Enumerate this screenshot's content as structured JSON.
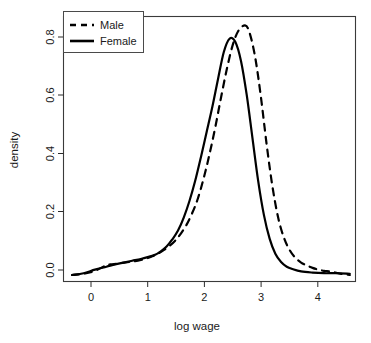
{
  "chart_data": {
    "type": "line",
    "title": "",
    "xlabel": "log wage",
    "ylabel": "density",
    "xlim": [
      -0.55,
      4.55
    ],
    "ylim": [
      -0.02,
      0.875
    ],
    "grid": false,
    "legend_position": "top-left",
    "xticks": [
      0,
      1,
      2,
      3,
      4
    ],
    "xtick_labels": [
      "0",
      "1",
      "2",
      "3",
      "4"
    ],
    "yticks": [
      0.0,
      0.2,
      0.4,
      0.6,
      0.8
    ],
    "ytick_labels": [
      "0.0",
      "0.2",
      "0.4",
      "0.6",
      "0.8"
    ],
    "series": [
      {
        "name": "Male",
        "style": "dashed",
        "color": "#000000",
        "peak_x": 2.62,
        "peak_y": 0.845,
        "x": [
          -0.4,
          -0.2,
          0.0,
          0.2,
          0.3,
          0.45,
          0.6,
          0.75,
          0.9,
          1.0,
          1.1,
          1.2,
          1.3,
          1.4,
          1.5,
          1.6,
          1.7,
          1.8,
          1.9,
          2.0,
          2.1,
          2.2,
          2.3,
          2.4,
          2.5,
          2.62,
          2.7,
          2.8,
          2.9,
          3.0,
          3.1,
          3.2,
          3.3,
          3.4,
          3.5,
          3.6,
          3.7,
          3.8,
          3.9,
          4.0,
          4.1,
          4.2,
          4.3,
          4.45
        ],
        "y": [
          0.002,
          0.006,
          0.016,
          0.035,
          0.038,
          0.042,
          0.046,
          0.05,
          0.058,
          0.065,
          0.074,
          0.086,
          0.1,
          0.118,
          0.142,
          0.172,
          0.212,
          0.262,
          0.33,
          0.41,
          0.5,
          0.6,
          0.695,
          0.775,
          0.825,
          0.845,
          0.82,
          0.735,
          0.6,
          0.44,
          0.3,
          0.195,
          0.128,
          0.086,
          0.06,
          0.044,
          0.034,
          0.026,
          0.02,
          0.016,
          0.014,
          0.01,
          0.006,
          0.002
        ]
      },
      {
        "name": "Female",
        "style": "solid",
        "color": "#000000",
        "peak_x": 2.35,
        "peak_y": 0.8,
        "x": [
          -0.4,
          -0.2,
          0.0,
          0.2,
          0.35,
          0.5,
          0.65,
          0.8,
          0.95,
          1.05,
          1.15,
          1.25,
          1.35,
          1.45,
          1.55,
          1.65,
          1.75,
          1.85,
          1.95,
          2.05,
          2.15,
          2.25,
          2.35,
          2.45,
          2.55,
          2.65,
          2.75,
          2.85,
          2.95,
          3.05,
          3.15,
          3.25,
          3.35,
          3.45,
          3.6,
          3.8,
          4.0,
          4.2,
          4.45
        ],
        "y": [
          0.002,
          0.008,
          0.02,
          0.03,
          0.038,
          0.044,
          0.05,
          0.056,
          0.064,
          0.07,
          0.082,
          0.098,
          0.122,
          0.152,
          0.196,
          0.252,
          0.32,
          0.4,
          0.485,
          0.57,
          0.665,
          0.755,
          0.8,
          0.79,
          0.725,
          0.61,
          0.465,
          0.32,
          0.205,
          0.125,
          0.074,
          0.046,
          0.03,
          0.022,
          0.014,
          0.01,
          0.008,
          0.008,
          0.006
        ]
      }
    ]
  },
  "legend": {
    "items": [
      {
        "label": "Male",
        "style": "dashed"
      },
      {
        "label": "Female",
        "style": "solid"
      }
    ]
  }
}
